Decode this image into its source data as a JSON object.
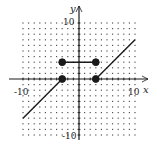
{
  "chart_data": {
    "type": "line",
    "title": "",
    "xlabel": "x",
    "ylabel": "y",
    "xlim": [
      -10,
      10
    ],
    "ylim": [
      -10,
      10
    ],
    "grid": "dotted",
    "tick_labels": {
      "x_min": "-10",
      "x_max": "10",
      "y_min": "-10",
      "y_max": "10"
    },
    "series": [
      {
        "name": "left ray",
        "points": [
          [
            -10,
            -7
          ],
          [
            -3,
            0
          ]
        ]
      },
      {
        "name": "middle segment",
        "points": [
          [
            -3,
            3
          ],
          [
            3,
            3
          ]
        ]
      },
      {
        "name": "right ray",
        "points": [
          [
            3,
            0
          ],
          [
            10,
            7
          ]
        ]
      }
    ],
    "markers": [
      {
        "x": -3,
        "y": 3,
        "filled": true
      },
      {
        "x": 3,
        "y": 3,
        "filled": true
      },
      {
        "x": -3,
        "y": 0,
        "filled": true
      },
      {
        "x": 3,
        "y": 0,
        "filled": true
      }
    ],
    "colors": {
      "line": "#1a1a1a",
      "grid": "#555555",
      "axis": "#1a1a1a"
    }
  }
}
